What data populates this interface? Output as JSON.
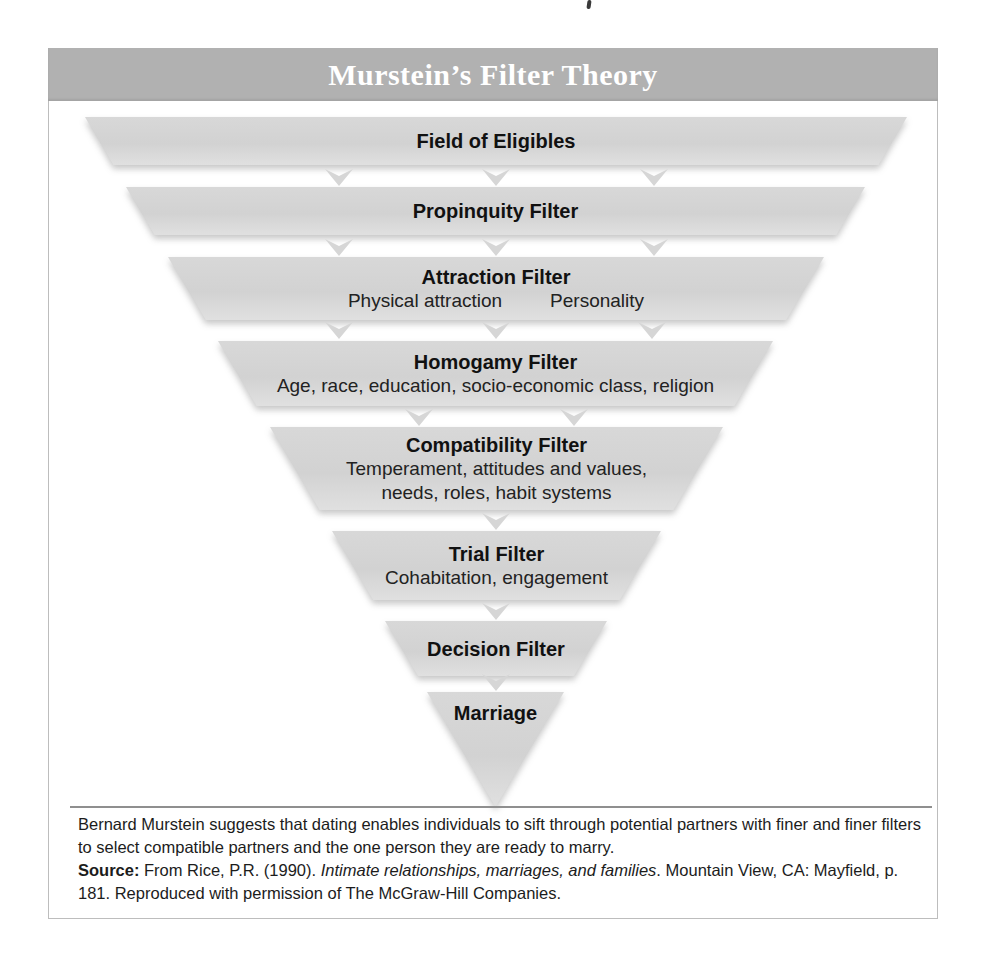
{
  "figure": {
    "title": "Murstein’s Filter Theory"
  },
  "theme": {
    "title_bar_color": "#b1b1b1",
    "title_text_color": "#ffffff",
    "funnel_fill_color": "#d2d2d2",
    "funnel_fill_highlight": "#d8d8d8",
    "arrow_color": "#d6d6d6"
  },
  "funnel": {
    "connector_icon": "down-arrow-icon",
    "levels": [
      {
        "id": "field-of-eligibles",
        "title": "Field of Eligibles",
        "sublines": []
      },
      {
        "id": "propinquity-filter",
        "title": "Propinquity Filter",
        "sublines": []
      },
      {
        "id": "attraction-filter",
        "title": "Attraction Filter",
        "sublines": [
          "Physical attraction",
          "Personality"
        ],
        "sub_layout": "row"
      },
      {
        "id": "homogamy-filter",
        "title": "Homogamy Filter",
        "sublines": [
          "Age, race, education, socio-economic class, religion"
        ]
      },
      {
        "id": "compatibility-filter",
        "title": "Compatibility Filter",
        "sublines": [
          "Temperament, attitudes and values,",
          "needs, roles, habit systems"
        ]
      },
      {
        "id": "trial-filter",
        "title": "Trial Filter",
        "sublines": [
          "Cohabitation, engagement"
        ]
      },
      {
        "id": "decision-filter",
        "title": "Decision Filter",
        "sublines": []
      },
      {
        "id": "marriage",
        "title": "Marriage",
        "sublines": []
      }
    ]
  },
  "caption": {
    "body": "Bernard Murstein suggests that dating enables individuals to sift through potential partners with finer and finer filters to select compatible partners and the one person they are ready to marry.",
    "source_label": "Source:",
    "source_text_1": " From Rice, P.R. (1990). ",
    "source_title_italic": "Intimate relationships, marriages, and families",
    "source_text_2": ". Mountain View, CA: Mayfield, p. 181. Reproduced with permission of The McGraw-Hill Companies."
  }
}
